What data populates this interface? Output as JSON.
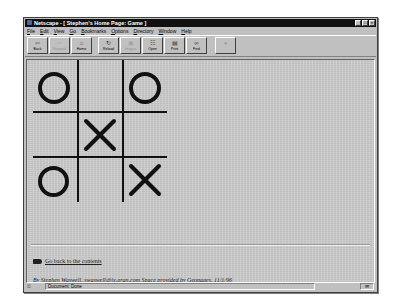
{
  "window": {
    "title": "Netscape - [ Stephen's Home Page: Game ]",
    "controls": [
      "minimize",
      "maximize",
      "close"
    ]
  },
  "menu": [
    "File",
    "Edit",
    "View",
    "Go",
    "Bookmarks",
    "Options",
    "Directory",
    "Window",
    "Help"
  ],
  "toolbar": {
    "buttons": [
      {
        "label": "Back",
        "icon": "back-arrow-icon",
        "enabled": true
      },
      {
        "label": "Forward",
        "icon": "forward-arrow-icon",
        "enabled": false
      },
      {
        "label": "Home",
        "icon": "home-icon",
        "enabled": true
      },
      {
        "label": "Reload",
        "icon": "reload-icon",
        "enabled": true
      },
      {
        "label": "Images",
        "icon": "images-icon",
        "enabled": false
      },
      {
        "label": "Open",
        "icon": "open-icon",
        "enabled": true
      },
      {
        "label": "Print",
        "icon": "printer-icon",
        "enabled": true
      },
      {
        "label": "Find",
        "icon": "binoculars-icon",
        "enabled": true
      },
      {
        "label": "Stop",
        "icon": "stop-icon",
        "enabled": false
      }
    ]
  },
  "game": {
    "board": [
      [
        "O",
        "",
        "O"
      ],
      [
        "",
        "X",
        ""
      ],
      [
        "O",
        "",
        "X"
      ]
    ]
  },
  "page": {
    "back_link": "Go back to the contents",
    "footer": {
      "author": "By Stephen Waswell,",
      "email": "swaswell@ix.gran.com",
      "space_text": "Space provided by",
      "host_link": "Geopages,",
      "date": "11/1/96"
    }
  },
  "status": {
    "text": "Document: Done"
  },
  "colors": {
    "chrome": "#c0c0c0",
    "titlebar": "#101010",
    "page_bg": "#c8c8c8",
    "ink": "#111111"
  }
}
